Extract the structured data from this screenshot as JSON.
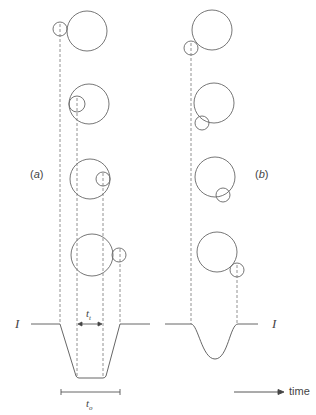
{
  "diagram": {
    "panels": [
      {
        "label": "(a)",
        "label_letter": "a"
      },
      {
        "label": "(b)",
        "label_letter": "b"
      }
    ],
    "signal_label_left": "I",
    "signal_label_right": "I",
    "transit_time_label": "t",
    "transit_time_subscript": "t",
    "total_time_label": "t",
    "total_time_subscript": "o",
    "axis_label": "time",
    "colors": {
      "line": "#555555",
      "dash": "#666666",
      "text": "#444444"
    },
    "panel_a_frames": [
      {
        "large": {
          "cx": 87,
          "cy": 31,
          "r": 20
        },
        "small": {
          "cx": 60,
          "cy": 29,
          "r": 7
        }
      },
      {
        "large": {
          "cx": 89,
          "cy": 104,
          "r": 20
        },
        "small": {
          "cx": 77,
          "cy": 104,
          "r": 8
        }
      },
      {
        "large": {
          "cx": 90,
          "cy": 179,
          "r": 20
        },
        "small": {
          "cx": 103,
          "cy": 179,
          "r": 7
        }
      },
      {
        "large": {
          "cx": 92,
          "cy": 255,
          "r": 21
        },
        "small": {
          "cx": 119,
          "cy": 255,
          "r": 7
        }
      }
    ],
    "panel_b_frames": [
      {
        "large": {
          "cx": 212,
          "cy": 30,
          "r": 20
        },
        "small": {
          "cx": 191,
          "cy": 48,
          "r": 7
        }
      },
      {
        "large": {
          "cx": 214,
          "cy": 103,
          "r": 20
        },
        "small": {
          "cx": 202,
          "cy": 123,
          "r": 7
        }
      },
      {
        "large": {
          "cx": 215,
          "cy": 177,
          "r": 20
        },
        "small": {
          "cx": 223,
          "cy": 195,
          "r": 7
        }
      },
      {
        "large": {
          "cx": 217,
          "cy": 252,
          "r": 20
        },
        "small": {
          "cx": 237,
          "cy": 270,
          "r": 7
        }
      }
    ]
  }
}
